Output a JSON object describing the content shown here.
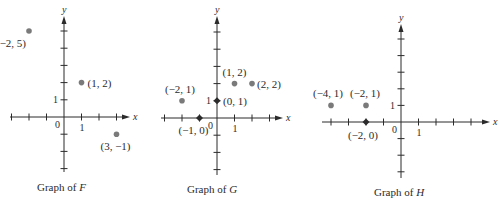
{
  "chart_data": [
    {
      "type": "scatter",
      "title": "Graph of F",
      "function_name": "F",
      "xlabel": "x",
      "ylabel": "y",
      "origin_label": "0",
      "tick_labels": {
        "x": "1",
        "y": "1"
      },
      "xlim": [
        -3,
        3
      ],
      "ylim": [
        -3,
        5
      ],
      "grid": false,
      "points": [
        {
          "x": -2,
          "y": 5,
          "label": "(−2, 5)",
          "marker": "dot"
        },
        {
          "x": 1,
          "y": 2,
          "label": "(1, 2)",
          "marker": "dot"
        },
        {
          "x": 3,
          "y": -1,
          "label": "(3, −1)",
          "marker": "dot"
        }
      ],
      "layout": {
        "ox": 64,
        "oy": 117,
        "ux": 17.5,
        "uy": 17.2,
        "x_axis": [
          10,
          130
        ],
        "y_axis": [
          172,
          16
        ],
        "x_ticks": [
          -3,
          -2,
          -1,
          1,
          2,
          3
        ],
        "y_ticks": [
          -3,
          -2,
          -1,
          1,
          2,
          3,
          4,
          5
        ],
        "labels": [
          {
            "dx": -33,
            "dy": 16,
            "anchor": "start"
          },
          {
            "dx": 6,
            "dy": 4,
            "anchor": "start"
          },
          {
            "dx": -16,
            "dy": 16,
            "anchor": "start"
          }
        ],
        "caption": {
          "x": 37,
          "y": 191
        }
      }
    },
    {
      "type": "scatter",
      "title": "Graph of G",
      "function_name": "G",
      "xlabel": "x",
      "ylabel": "y",
      "origin_label": "0",
      "tick_labels": {
        "x": "1",
        "y": "1"
      },
      "xlim": [
        -3,
        3
      ],
      "ylim": [
        -3,
        5
      ],
      "grid": false,
      "points": [
        {
          "x": -2,
          "y": 1,
          "label": "(−2, 1)",
          "marker": "dot"
        },
        {
          "x": -1,
          "y": 0,
          "label": "(−1, 0)",
          "marker": "diamond"
        },
        {
          "x": 0,
          "y": 1,
          "label": "(0, 1)",
          "marker": "diamond"
        },
        {
          "x": 1,
          "y": 2,
          "label": "(1, 2)",
          "marker": "dot"
        },
        {
          "x": 2,
          "y": 2,
          "label": "(2, 2)",
          "marker": "dot"
        }
      ],
      "layout": {
        "ox": 217,
        "oy": 118,
        "ux": 17.5,
        "uy": 17.2,
        "x_axis": [
          161,
          283
        ],
        "y_axis": [
          175,
          16
        ],
        "x_ticks": [
          -3,
          -2,
          -1,
          1,
          2,
          3
        ],
        "y_ticks": [
          -3,
          -2,
          -1,
          1,
          2,
          3,
          4,
          5
        ],
        "labels": [
          {
            "dx": -17,
            "dy": -8,
            "anchor": "start"
          },
          {
            "dx": -21,
            "dy": 16,
            "anchor": "start"
          },
          {
            "dx": 6,
            "dy": 4,
            "anchor": "start"
          },
          {
            "dx": -12,
            "dy": -8,
            "anchor": "start"
          },
          {
            "dx": 5,
            "dy": 4,
            "anchor": "start"
          }
        ],
        "caption": {
          "x": 187,
          "y": 193
        }
      }
    },
    {
      "type": "scatter",
      "title": "Graph of H",
      "function_name": "H",
      "xlabel": "x",
      "ylabel": "y",
      "origin_label": "0",
      "tick_labels": {
        "x": "1",
        "y": "1"
      },
      "xlim": [
        -5,
        5
      ],
      "ylim": [
        -3,
        5
      ],
      "grid": false,
      "points": [
        {
          "x": -4,
          "y": 1,
          "label": "(−4, 1)",
          "marker": "dot"
        },
        {
          "x": -2,
          "y": 1,
          "label": "(−2, 1)",
          "marker": "dot"
        },
        {
          "x": -2,
          "y": 0,
          "label": "(−2, 0)",
          "marker": "diamond"
        }
      ],
      "layout": {
        "ox": 401,
        "oy": 122,
        "ux": 17.5,
        "uy": 16.6,
        "x_axis": [
          322,
          490
        ],
        "y_axis": [
          178,
          24
        ],
        "x_ticks": [
          -4,
          -3,
          -2,
          -1,
          1,
          2,
          3,
          4
        ],
        "y_ticks": [
          -3,
          -2,
          -1,
          1,
          2,
          3,
          4,
          5
        ],
        "labels": [
          {
            "dx": -18,
            "dy": -8,
            "anchor": "start"
          },
          {
            "dx": -16,
            "dy": -8,
            "anchor": "start"
          },
          {
            "dx": -18,
            "dy": 17,
            "anchor": "start"
          }
        ],
        "caption": {
          "x": 374,
          "y": 196
        }
      }
    }
  ],
  "captions": {
    "prefix": "Graph of",
    "f": "F",
    "g": "G",
    "h": "H"
  },
  "colors": {
    "ink": "#2b2b2b",
    "point": "#7a7a7a",
    "background": "#ffffff"
  }
}
